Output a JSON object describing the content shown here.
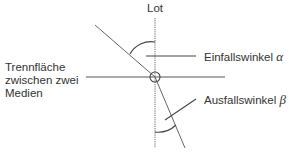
{
  "diagram": {
    "normal_label": "Lot",
    "interface_label_lines": [
      "Trennfläche",
      "zwischen zwei",
      "Medien"
    ],
    "incidence_angle_label": "Einfallswinkel",
    "incidence_angle_symbol": "α",
    "refraction_angle_label": "Ausfallswinkel",
    "refraction_angle_symbol": "β",
    "colors": {
      "line": "#555555",
      "text": "#333333",
      "background": "#ffffff"
    }
  }
}
